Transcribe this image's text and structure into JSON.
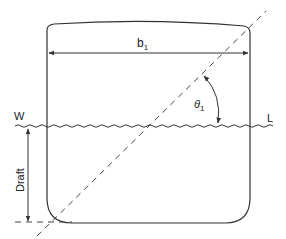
{
  "diagram": {
    "colors": {
      "stroke": "#333333",
      "background": "#ffffff"
    },
    "labels": {
      "beam": "b",
      "beam_subscript": "1",
      "waterline_left": "W",
      "waterline_right": "L",
      "angle": "θ",
      "angle_subscript": "1",
      "draft": "Draft"
    },
    "elements": [
      {
        "id": "hull",
        "type": "rounded-box-section"
      },
      {
        "id": "beam-dimension",
        "type": "double-arrow",
        "label": "b1"
      },
      {
        "id": "waterline",
        "type": "wavy-line",
        "ends": [
          "W",
          "L"
        ]
      },
      {
        "id": "inclined-line",
        "type": "dashed-diagonal"
      },
      {
        "id": "heel-angle",
        "type": "arc-arrow",
        "label": "θ1"
      },
      {
        "id": "draft-dimension",
        "type": "vertical-arrow",
        "label": "Draft"
      },
      {
        "id": "baseline",
        "type": "dashed-horizontal"
      }
    ]
  }
}
